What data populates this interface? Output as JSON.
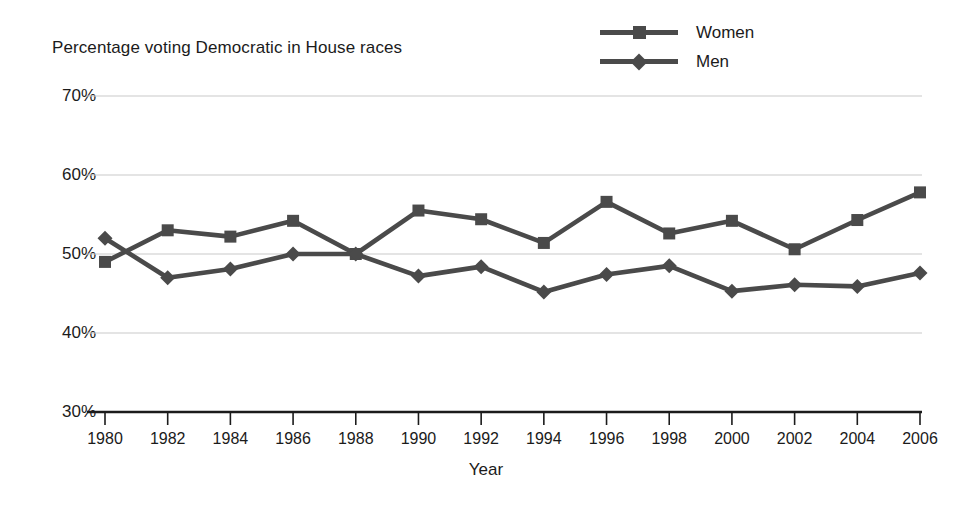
{
  "chart_data": {
    "type": "line",
    "title": "Percentage voting Democratic in House races",
    "xlabel": "Year",
    "ylabel": "",
    "categories": [
      1980,
      1982,
      1984,
      1986,
      1988,
      1990,
      1992,
      1994,
      1996,
      1998,
      2000,
      2002,
      2004,
      2006
    ],
    "x_tick_labels": [
      "1980",
      "1982",
      "1984",
      "1986",
      "1988",
      "1990",
      "1992",
      "1994",
      "1996",
      "1998",
      "2000",
      "2002",
      "2004",
      "2006"
    ],
    "y_tick_labels": [
      "30%",
      "40%",
      "50%",
      "60%",
      "70%"
    ],
    "y_ticks": [
      30,
      40,
      50,
      60,
      70
    ],
    "ylim": [
      30,
      70
    ],
    "xlim": [
      1980,
      2006
    ],
    "grid": true,
    "legend_position": "top-right",
    "series": [
      {
        "name": "Women",
        "marker": "square",
        "color": "#4a4a4a",
        "values": [
          49.0,
          53.0,
          52.2,
          54.2,
          50.0,
          55.5,
          54.4,
          51.4,
          56.6,
          52.6,
          54.2,
          50.6,
          54.3,
          57.8
        ]
      },
      {
        "name": "Men",
        "marker": "diamond",
        "color": "#4a4a4a",
        "values": [
          52.0,
          47.0,
          48.1,
          50.0,
          50.0,
          47.2,
          48.4,
          45.2,
          47.4,
          48.5,
          45.3,
          46.1,
          45.9,
          47.6
        ]
      }
    ]
  },
  "legend": {
    "items": [
      {
        "label": "Women",
        "marker": "square"
      },
      {
        "label": "Men",
        "marker": "diamond"
      }
    ]
  },
  "colors": {
    "series": "#4a4a4a",
    "gridline": "#c9c9c9",
    "axis": "#1b1b1b",
    "text": "#1b1b1b",
    "background": "#ffffff"
  }
}
